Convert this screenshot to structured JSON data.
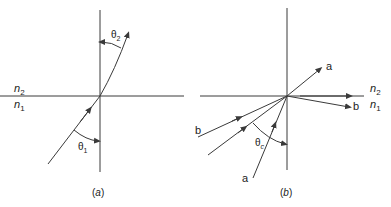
{
  "figure": {
    "panel_a": {
      "caption_open": "(",
      "caption_letter": "a",
      "caption_close": ")",
      "medium_top": "n",
      "medium_top_sub": "2",
      "medium_bottom": "n",
      "medium_bottom_sub": "1",
      "angle_incident": "θ",
      "angle_incident_sub": "1",
      "angle_refracted": "θ",
      "angle_refracted_sub": "2"
    },
    "panel_b": {
      "caption_open": "(",
      "caption_letter": "b",
      "caption_close": ")",
      "medium_top": "n",
      "medium_top_sub": "2",
      "medium_bottom": "n",
      "medium_bottom_sub": "1",
      "critical_angle": "θ",
      "critical_angle_sub": "c",
      "ray_a_in": "a",
      "ray_a_out": "a",
      "ray_b_in": "b",
      "ray_b_out": "b"
    },
    "colors": {
      "line": "#3a3a3a",
      "text": "#222222",
      "background": "#ffffff"
    }
  }
}
